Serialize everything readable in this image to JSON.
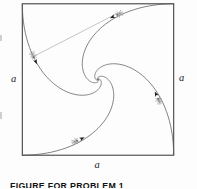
{
  "caption": "FIGURE FOR PROBLEM 1",
  "figure": {
    "side_labels": {
      "left": "a",
      "right": "a",
      "bottom": "a"
    },
    "colors": {
      "background": "#fdfdfd",
      "outline": "#3a3a3a",
      "curve": "#5a5a5a",
      "sight_line": "#949494",
      "arrow": "#1c1c1c",
      "bug_body": "#b3b3b3",
      "bug_dark": "#6b6b6b",
      "bug_leg": "#8a8a8a",
      "label": "#222222",
      "caption": "#111111"
    },
    "square": {
      "x": 22.3,
      "y": 3.8,
      "width": 151.4,
      "height": 151.4
    },
    "spiral": {
      "cx": 98,
      "cy": 79.5,
      "r0": 107.05,
      "start_deg": 135,
      "sweep_deg": 350,
      "decay_per_rad": 1,
      "arms_deg": [
        0,
        90,
        180,
        270
      ]
    },
    "bugs": [
      {
        "name": "left-bug",
        "x": 33,
        "y": 55.5,
        "angle_deg": 65
      },
      {
        "name": "top-bug",
        "x": 119,
        "y": 14,
        "angle_deg": 155
      },
      {
        "name": "right-bug",
        "x": 159,
        "y": 100.5,
        "angle_deg": 245
      },
      {
        "name": "bottom-bug",
        "x": 75.5,
        "y": 141.5,
        "angle_deg": 335
      }
    ],
    "arrows": [
      {
        "x": 35.7,
        "y": 61.4,
        "angle_deg": 65
      },
      {
        "x": 112.8,
        "y": 16.9,
        "angle_deg": 155
      },
      {
        "x": 156.1,
        "y": 94.3,
        "angle_deg": 245
      },
      {
        "x": 81.7,
        "y": 138.6,
        "angle_deg": 335
      }
    ],
    "sight_line": {
      "x1": 116,
      "y1": 14,
      "x2": 34.5,
      "y2": 56
    }
  }
}
